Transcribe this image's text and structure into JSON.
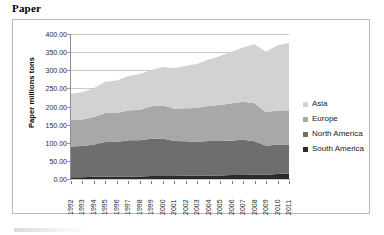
{
  "figure": {
    "title": "Paper"
  },
  "legend": {
    "position": "right",
    "items": [
      {
        "label": "Asia",
        "color": "#d2d2d2"
      },
      {
        "label": "Europe",
        "color": "#a8a8a8"
      },
      {
        "label": "North America",
        "color": "#6e6e6e"
      },
      {
        "label": "South America",
        "color": "#2b2b2b"
      }
    ]
  },
  "chart_data": {
    "type": "area",
    "stacked": true,
    "title": "Paper",
    "xlabel": "",
    "ylabel": "Paper millions tons",
    "ylim": [
      0,
      400
    ],
    "ytick_step": 50,
    "grid": true,
    "ytick_labels": [
      "0.00",
      "50.00",
      "100.00",
      "150.00",
      "200.00",
      "250.00",
      "300.00",
      "350.00",
      "400.00"
    ],
    "categories": [
      "1992",
      "1993",
      "1994",
      "1995",
      "1996",
      "1997",
      "1998",
      "1999",
      "2000",
      "2001",
      "2002",
      "2003",
      "2004",
      "2005",
      "2006",
      "2007",
      "2008",
      "2009",
      "2010",
      "2011"
    ],
    "series": [
      {
        "name": "South America",
        "color": "#2b2b2b",
        "values": [
          5,
          5,
          6,
          6,
          7,
          7,
          7,
          8,
          8,
          8,
          9,
          9,
          10,
          10,
          11,
          11,
          12,
          12,
          14,
          15
        ]
      },
      {
        "name": "North America",
        "color": "#6e6e6e",
        "values": [
          85,
          86,
          89,
          96,
          95,
          100,
          100,
          103,
          104,
          97,
          95,
          94,
          95,
          95,
          95,
          97,
          92,
          80,
          81,
          80
        ]
      },
      {
        "name": "Europe",
        "color": "#a8a8a8",
        "values": [
          72,
          73,
          76,
          80,
          80,
          82,
          84,
          90,
          91,
          89,
          91,
          93,
          97,
          99,
          103,
          105,
          105,
          92,
          94,
          95
        ]
      },
      {
        "name": "Asia",
        "color": "#d2d2d2",
        "values": [
          73,
          76,
          80,
          86,
          90,
          95,
          99,
          100,
          106,
          112,
          117,
          122,
          128,
          135,
          142,
          150,
          163,
          167,
          179,
          186
        ]
      }
    ],
    "totals": [
      235,
      240,
      251,
      268,
      272,
      284,
      290,
      301,
      309,
      306,
      312,
      318,
      330,
      339,
      351,
      363,
      372,
      351,
      368,
      376
    ]
  }
}
